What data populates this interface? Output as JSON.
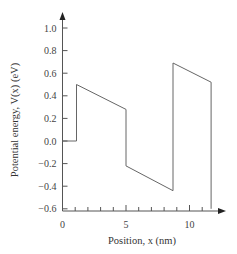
{
  "chart_data": {
    "type": "line",
    "title": "",
    "xlabel": "Position, x (nm)",
    "ylabel": "Potential energy, V(x) (eV)",
    "xlim": [
      0,
      12
    ],
    "ylim": [
      -0.6,
      1.1
    ],
    "grid": false,
    "legend": null,
    "x_ticks": [
      0,
      5,
      10
    ],
    "x_minor_ticks": [
      1,
      2,
      3,
      4,
      6,
      7,
      8,
      9,
      11
    ],
    "y_ticks": [
      -0.6,
      -0.4,
      -0.2,
      0.0,
      0.2,
      0.4,
      0.6,
      0.8,
      1.0
    ],
    "x_tick_labels": [
      "0",
      "5",
      "10"
    ],
    "y_tick_labels": [
      "-0.6",
      "-0.4",
      "-0.2",
      "0.0",
      "0.2",
      "0.4",
      "0.6",
      "0.8",
      "1.0"
    ],
    "series": [
      {
        "name": "V(x)",
        "points": [
          [
            0,
            0.0
          ],
          [
            1.1,
            0.0
          ],
          [
            1.1,
            0.5
          ],
          [
            5.0,
            0.28
          ],
          [
            5.0,
            -0.22
          ],
          [
            8.7,
            -0.44
          ],
          [
            8.7,
            0.69
          ],
          [
            11.7,
            0.52
          ],
          [
            11.7,
            -0.6
          ]
        ]
      }
    ]
  }
}
